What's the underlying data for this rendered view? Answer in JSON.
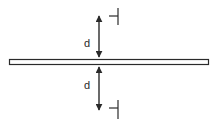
{
  "diagram": {
    "labels": {
      "top_distance": "d",
      "bottom_distance": "d"
    },
    "colors": {
      "stroke": "#2a2a2a",
      "plate_fill": "#ffffff",
      "background": "#ffffff"
    }
  }
}
